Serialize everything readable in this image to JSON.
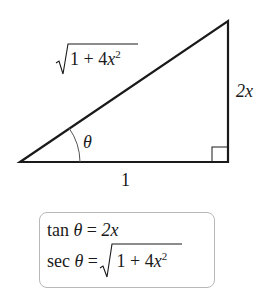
{
  "diagram": {
    "type": "right-triangle",
    "sides": {
      "hypotenuse": {
        "radical": "1 + 4x",
        "exponent": "2"
      },
      "opposite": "2x",
      "adjacent": "1"
    },
    "angle": "θ",
    "right_angle_marker": true
  },
  "formulas": {
    "tan": {
      "lhs": "tan θ",
      "eq": "=",
      "rhs": "2x"
    },
    "sec": {
      "lhs": "sec θ",
      "eq": "=",
      "rhs_radical": "1 + 4x",
      "rhs_exponent": "2"
    }
  }
}
